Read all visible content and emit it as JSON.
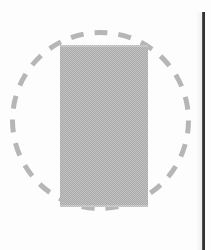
{
  "figure": {
    "title": "Dashed circle enclosing solid grey rectangle",
    "caption": "",
    "width": 211,
    "height": 250,
    "background_color": "#fdfdfd"
  },
  "shapes": {
    "circle": {
      "name": "dashed-circle",
      "style": "dashed",
      "stroke_color": "#b6b6b6",
      "stroke_width": 5,
      "dash_pattern": "13 11",
      "fill": "none",
      "center_x": 100,
      "center_y": 120,
      "radius": 88,
      "label": ""
    },
    "rectangle": {
      "name": "grey-rectangle",
      "style": "solid",
      "fill_color": "#a9a9a9",
      "fill_texture": "halftone-dither",
      "stroke": "none",
      "x": 60,
      "y": 45,
      "width": 88,
      "height": 162,
      "label": ""
    },
    "vertical_rule": {
      "name": "page-edge-rule",
      "style": "solid",
      "color": "#2e2e2e",
      "x": 202,
      "y": 12,
      "width": 3,
      "height": 238,
      "label": ""
    }
  },
  "annotations": [],
  "legend": []
}
